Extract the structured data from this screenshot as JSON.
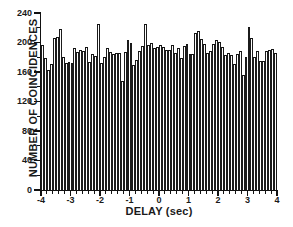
{
  "chart_data": {
    "type": "bar",
    "title": "",
    "subtitle": "",
    "xlabel": "DELAY (sec)",
    "ylabel": "NUMBER OF COINCIDENCES",
    "xlim": [
      -4,
      4
    ],
    "ylim": [
      0,
      240
    ],
    "xticks": [
      -4,
      -3,
      -2,
      -1,
      0,
      1,
      2,
      3,
      4
    ],
    "xtick_labels": [
      "-4",
      "-3",
      "-2",
      "-1",
      "0",
      "1",
      "2",
      "3",
      "4"
    ],
    "yticks": [
      0,
      40,
      80,
      120,
      160,
      200,
      240
    ],
    "ytick_labels": [
      "0",
      "40",
      "80",
      "120",
      "160",
      "200",
      "240"
    ],
    "x_minor_tick_interval": 0.2,
    "y_minor_tick_interval": 20,
    "grid": false,
    "legend": null,
    "bin_width": 0.1,
    "bin_count": 80,
    "bar_fill": "#ffffff",
    "bar_edge": "#111111",
    "x": [
      -3.95,
      -3.85,
      -3.75,
      -3.65,
      -3.55,
      -3.45,
      -3.35,
      -3.25,
      -3.15,
      -3.05,
      -2.95,
      -2.85,
      -2.75,
      -2.65,
      -2.55,
      -2.45,
      -2.35,
      -2.25,
      -2.15,
      -2.05,
      -1.95,
      -1.85,
      -1.75,
      -1.65,
      -1.55,
      -1.45,
      -1.35,
      -1.25,
      -1.15,
      -1.05,
      -0.95,
      -0.85,
      -0.75,
      -0.65,
      -0.55,
      -0.45,
      -0.35,
      -0.25,
      -0.15,
      -0.05,
      0.05,
      0.15,
      0.25,
      0.35,
      0.45,
      0.55,
      0.65,
      0.75,
      0.85,
      0.95,
      1.05,
      1.15,
      1.25,
      1.35,
      1.45,
      1.55,
      1.65,
      1.75,
      1.85,
      1.95,
      2.05,
      2.15,
      2.25,
      2.35,
      2.45,
      2.55,
      2.65,
      2.75,
      2.85,
      2.95,
      3.05,
      3.15,
      3.25,
      3.35,
      3.45,
      3.55,
      3.65,
      3.75,
      3.85,
      3.95
    ],
    "values": [
      196,
      179,
      163,
      171,
      206,
      208,
      218,
      180,
      172,
      173,
      172,
      193,
      187,
      190,
      189,
      194,
      173,
      185,
      182,
      225,
      172,
      180,
      192,
      187,
      185,
      186,
      186,
      148,
      187,
      204,
      200,
      170,
      176,
      189,
      195,
      225,
      197,
      200,
      192,
      194,
      197,
      194,
      190,
      190,
      197,
      186,
      192,
      179,
      195,
      198,
      185,
      184,
      213,
      216,
      205,
      198,
      186,
      189,
      198,
      204,
      201,
      194,
      183,
      186,
      183,
      171,
      185,
      189,
      156,
      180,
      221,
      206,
      180,
      189,
      175,
      175,
      189,
      190,
      191,
      186
    ]
  }
}
